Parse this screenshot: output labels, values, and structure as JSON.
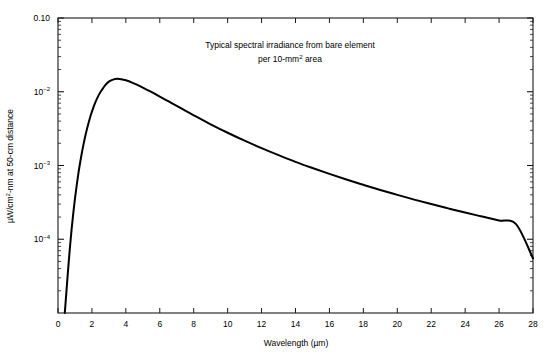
{
  "figure": {
    "background_color": "#ffffff",
    "line_color": "#000000",
    "axis_color": "#1a1a1a"
  },
  "annotation": {
    "line1": "Typical spectral irradiance from bare element",
    "line2_pre": "per 10-mm",
    "line2_sup": "2",
    "line2_post": " area"
  },
  "axes": {
    "x_title": "Wavelength (µm)",
    "y_title_pre": "µW/cm",
    "y_title_sup": "2",
    "y_title_post": "-nm at 50-cm distance",
    "x_ticks": [
      "0",
      "2",
      "4",
      "6",
      "8",
      "10",
      "12",
      "14",
      "16",
      "18",
      "20",
      "22",
      "24",
      "26",
      "28"
    ],
    "y_ticks": [
      {
        "label": "0.10",
        "mantissa": null,
        "exponent": null,
        "value": 0.1
      },
      {
        "label": null,
        "mantissa": "10",
        "exponent": "−2",
        "value": 0.01
      },
      {
        "label": null,
        "mantissa": "10",
        "exponent": "−3",
        "value": 0.001
      },
      {
        "label": null,
        "mantissa": "10",
        "exponent": "−4",
        "value": 0.0001
      }
    ]
  },
  "chart_data": {
    "type": "line",
    "title": "",
    "subtitle": "",
    "annotation": "Typical spectral irradiance from bare element per 10-mm2 area",
    "xlabel": "Wavelength (µm)",
    "ylabel": "µW/cm2-nm at 50-cm distance",
    "xlim": [
      0,
      28
    ],
    "ylim": [
      1e-05,
      0.1
    ],
    "yscale": "log",
    "xscale": "linear",
    "grid": false,
    "legend": false,
    "xticks": [
      0,
      2,
      4,
      6,
      8,
      10,
      12,
      14,
      16,
      18,
      20,
      22,
      24,
      26,
      28
    ],
    "yticks": [
      0.0001,
      0.001,
      0.01,
      0.1
    ],
    "ytick_labels": [
      "10^-4",
      "10^-3",
      "10^-2",
      "0.10"
    ],
    "series": [
      {
        "name": "Spectral irradiance",
        "color": "#000000",
        "linewidth": 2.0,
        "x": [
          0.4,
          0.5,
          0.6,
          0.7,
          0.8,
          0.9,
          1.0,
          1.1,
          1.2,
          1.3,
          1.4,
          1.5,
          1.6,
          1.7,
          1.8,
          1.9,
          2.0,
          2.2,
          2.4,
          2.6,
          2.8,
          3.0,
          3.2,
          3.5,
          4.0,
          4.5,
          5.0,
          5.5,
          6.0,
          6.5,
          7.0,
          7.5,
          8.0,
          9.0,
          10.0,
          11.0,
          12.0,
          13.0,
          14.0,
          15.0,
          16.0,
          17.0,
          18.0,
          19.0,
          20.0,
          21.0,
          22.0,
          23.0,
          24.0,
          25.0,
          26.0,
          27.0,
          28.0
        ],
        "y": [
          1e-05,
          2e-05,
          4e-05,
          7.6e-05,
          0.000135,
          0.000225,
          0.000355,
          0.000535,
          0.000775,
          0.00108,
          0.00146,
          0.00192,
          0.00246,
          0.00308,
          0.00378,
          0.00455,
          0.00538,
          0.00716,
          0.009,
          0.0107,
          0.0124,
          0.0137,
          0.0145,
          0.015,
          0.0143,
          0.0129,
          0.0114,
          0.00995,
          0.00862,
          0.00744,
          0.00642,
          0.00554,
          0.00479,
          0.00362,
          0.00278,
          0.00217,
          0.00172,
          0.00138,
          0.00112,
          0.000925,
          0.00077,
          0.000646,
          0.000547,
          0.000466,
          0.0004,
          0.000345,
          0.0003,
          0.000262,
          0.00023,
          0.000203,
          0.00018,
          0.00016,
          5.5e-05
        ]
      }
    ]
  }
}
